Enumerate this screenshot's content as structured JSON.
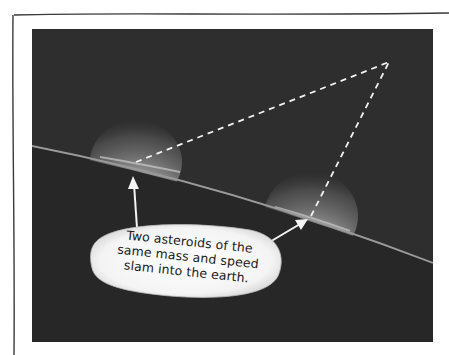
{
  "figure": {
    "colors": {
      "background": "#ffffff",
      "frame_line": "#333333",
      "panel": "#2e2e2e",
      "earth_line": "#9a9a9a",
      "glow": "#e8e8e8",
      "dash": "#f2f2f2",
      "bubble": "#f7f7f7",
      "text": "#1a1a1a"
    },
    "callout": {
      "lines": [
        "Two asteroids of the",
        "same mass and speed",
        "slam into the earth."
      ]
    },
    "impacts": [
      {
        "name": "left-impact",
        "x": 136,
        "y": 162
      },
      {
        "name": "right-impact",
        "x": 311,
        "y": 216
      }
    ],
    "apex": {
      "x": 389,
      "y": 62
    }
  }
}
